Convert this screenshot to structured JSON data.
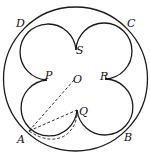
{
  "diagram": {
    "labels": {
      "A": "A",
      "B": "B",
      "C": "C",
      "D": "D",
      "P": "P",
      "Q": "Q",
      "R": "R",
      "S": "S",
      "O": "O"
    },
    "colors": {
      "stroke": "#1a1a1a",
      "background": "#ffffff"
    }
  }
}
